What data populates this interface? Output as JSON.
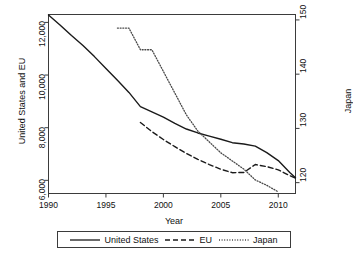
{
  "chart_data": {
    "type": "line",
    "title": "",
    "xlabel": "Year",
    "ylabel_left": "United States and EU",
    "ylabel_right": "Japan",
    "xlim": [
      1990,
      2011.5
    ],
    "xticks": [
      1990,
      1995,
      2000,
      2005,
      2010
    ],
    "xtick_labels": [
      "1990",
      "1995",
      "2000",
      "2005",
      "2010"
    ],
    "ylim_left": [
      5500,
      12300
    ],
    "yticks_left": [
      6000,
      8000,
      10000,
      12000
    ],
    "ytick_labels_left": [
      "6,000",
      "8,000",
      "10,000",
      "12,000"
    ],
    "ylim_right": [
      118,
      151
    ],
    "yticks_right": [
      120,
      130,
      140,
      150
    ],
    "ytick_labels_right": [
      "120",
      "130",
      "140",
      "150"
    ],
    "grid": false,
    "legend_position": "below",
    "series": [
      {
        "name": "United States",
        "axis": "left",
        "style": "solid",
        "color": "#1a1a1a",
        "x": [
          1990,
          1991,
          1992,
          1993,
          1994,
          1995,
          1996,
          1997,
          1998,
          1999,
          2000,
          2001,
          2002,
          2003,
          2004,
          2005,
          2006,
          2007,
          2008,
          2009,
          2010,
          2011,
          2011.5
        ],
        "values": [
          12280,
          11900,
          11500,
          11120,
          10700,
          10250,
          9800,
          9340,
          8800,
          8600,
          8400,
          8160,
          7950,
          7800,
          7680,
          7560,
          7430,
          7380,
          7300,
          7050,
          6750,
          6300,
          6100
        ]
      },
      {
        "name": "EU",
        "axis": "left",
        "style": "dashed",
        "color": "#1a1a1a",
        "x": [
          1998,
          1999,
          2000,
          2001,
          2002,
          2003,
          2004,
          2005,
          2006,
          2007,
          2008,
          2009,
          2010,
          2011,
          2011.5
        ],
        "values": [
          8200,
          7850,
          7550,
          7280,
          7020,
          6800,
          6600,
          6420,
          6290,
          6300,
          6600,
          6520,
          6400,
          6180,
          6080
        ]
      },
      {
        "name": "Japan",
        "axis": "right",
        "style": "dotted",
        "color": "#4a4a4a",
        "x": [
          1996,
          1997,
          1998,
          1999,
          2000,
          2001,
          2002,
          2003,
          2004,
          2005,
          2006,
          2007,
          2008,
          2009,
          2010
        ],
        "values": [
          148.5,
          148.5,
          144.5,
          144.5,
          140.5,
          136.5,
          132.5,
          129.5,
          127.5,
          125.5,
          124.0,
          122.5,
          120.5,
          119.5,
          118.3
        ]
      }
    ]
  },
  "legend": {
    "items": [
      {
        "label": "United States",
        "style": "solid"
      },
      {
        "label": "EU",
        "style": "dashed"
      },
      {
        "label": "Japan",
        "style": "dotted"
      }
    ]
  }
}
